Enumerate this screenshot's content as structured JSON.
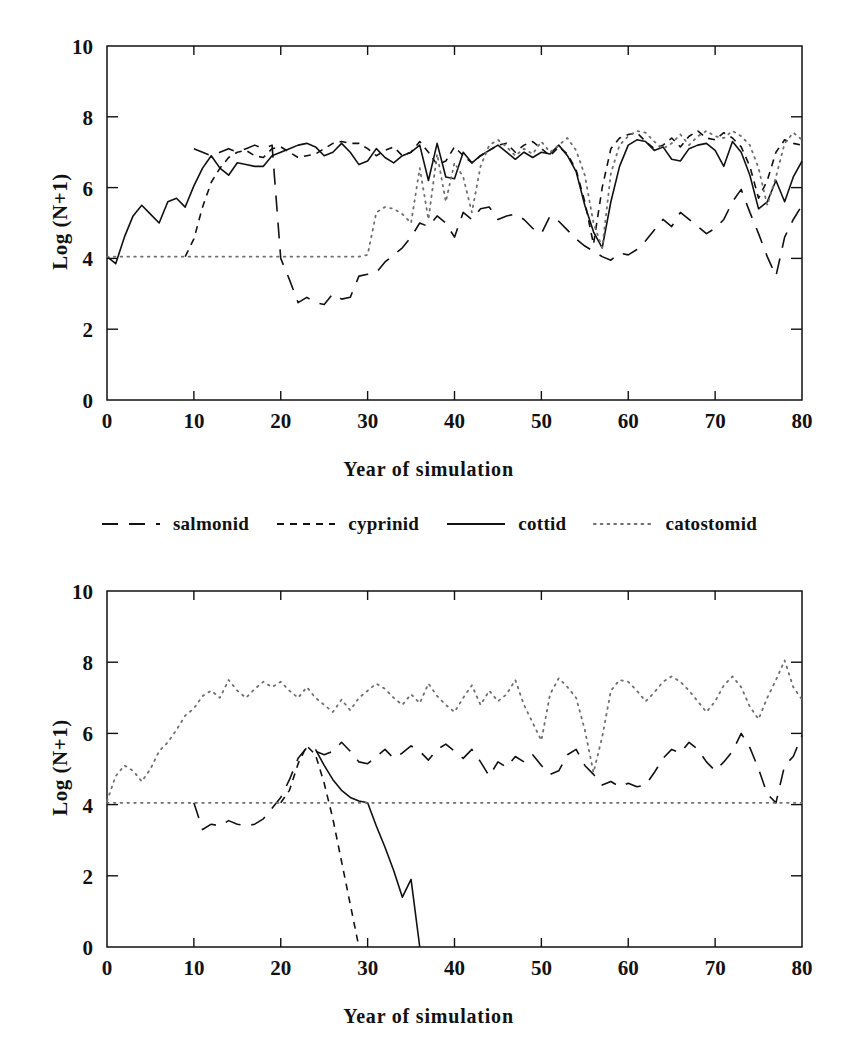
{
  "page": {
    "faint_header_text": "",
    "background": "#ffffff",
    "ink": "#111111"
  },
  "legend": {
    "name": "series-legend",
    "items": [
      {
        "label": "salmonid",
        "style": "long-dash",
        "dash": "16,11",
        "width": 1.6,
        "color": "#111111"
      },
      {
        "label": "cyprinid",
        "style": "short-dash",
        "dash": "7,6",
        "width": 1.6,
        "color": "#111111"
      },
      {
        "label": "cottid",
        "style": "solid",
        "dash": "none",
        "width": 1.6,
        "color": "#111111"
      },
      {
        "label": "catostomid",
        "style": "dotted",
        "dash": "1.6,5.2",
        "width": 1.8,
        "color": "#6e6e6e"
      }
    ]
  },
  "chart_data": [
    {
      "id": "top-panel",
      "type": "line",
      "title": "",
      "xlabel": "Year of simulation",
      "ylabel": "Log (N+1)",
      "xlim": [
        0,
        80
      ],
      "ylim": [
        0,
        10
      ],
      "xticks": [
        0,
        10,
        20,
        30,
        40,
        50,
        60,
        70,
        80
      ],
      "yticks": [
        0,
        2,
        4,
        6,
        8,
        10
      ],
      "grid": false,
      "legend_position": "below-panel",
      "series": [
        {
          "name": "salmonid",
          "style": "long-dash",
          "x": [
            10,
            11,
            12,
            13,
            14,
            15,
            16,
            17,
            18,
            19,
            20,
            21,
            22,
            23,
            24,
            25,
            26,
            27,
            28,
            29,
            30,
            31,
            32,
            33,
            34,
            35,
            36,
            37,
            38,
            39,
            40,
            41,
            42,
            43,
            44,
            45,
            46,
            47,
            48,
            49,
            50,
            51,
            52,
            53,
            54,
            55,
            56,
            57,
            58,
            59,
            60,
            61,
            62,
            63,
            64,
            65,
            66,
            67,
            68,
            69,
            70,
            71,
            72,
            73,
            74,
            75,
            76,
            77,
            78,
            79,
            80
          ],
          "values": [
            7.1,
            7.0,
            6.9,
            7.0,
            7.1,
            7.0,
            7.1,
            7.2,
            7.1,
            7.2,
            4.0,
            3.4,
            2.75,
            2.9,
            2.75,
            2.7,
            3.0,
            2.85,
            2.9,
            3.5,
            3.55,
            3.6,
            3.9,
            4.1,
            4.3,
            4.6,
            5.0,
            4.9,
            5.2,
            5.0,
            4.6,
            5.3,
            5.1,
            5.4,
            5.45,
            5.1,
            5.2,
            5.25,
            5.1,
            4.85,
            4.7,
            5.2,
            5.05,
            4.8,
            4.55,
            4.35,
            4.2,
            4.05,
            3.95,
            4.15,
            4.1,
            4.25,
            4.5,
            4.8,
            5.1,
            4.9,
            5.3,
            5.1,
            4.9,
            4.7,
            4.85,
            5.1,
            5.6,
            5.95,
            5.3,
            4.7,
            4.05,
            3.5,
            4.6,
            5.1,
            5.5
          ]
        },
        {
          "name": "cyprinid",
          "style": "short-dash",
          "x": [
            9,
            10,
            11,
            12,
            13,
            14,
            15,
            16,
            17,
            18,
            19,
            20,
            21,
            22,
            23,
            24,
            25,
            26,
            27,
            28,
            29,
            30,
            31,
            32,
            33,
            34,
            35,
            36,
            37,
            38,
            39,
            40,
            41,
            42,
            43,
            44,
            45,
            46,
            47,
            48,
            49,
            50,
            51,
            52,
            53,
            54,
            55,
            56,
            57,
            58,
            59,
            60,
            61,
            62,
            63,
            64,
            65,
            66,
            67,
            68,
            69,
            70,
            71,
            72,
            73,
            74,
            75,
            76,
            77,
            78,
            79,
            80
          ],
          "values": [
            4.05,
            4.55,
            5.45,
            6.15,
            6.55,
            6.85,
            7.0,
            7.05,
            6.9,
            6.85,
            7.1,
            7.15,
            7.0,
            6.85,
            6.9,
            6.95,
            7.1,
            7.25,
            7.3,
            7.25,
            7.25,
            7.1,
            6.9,
            7.05,
            7.15,
            6.9,
            7.0,
            7.3,
            7.0,
            6.65,
            6.75,
            7.15,
            6.9,
            6.7,
            6.9,
            7.05,
            7.2,
            7.25,
            7.0,
            7.2,
            7.3,
            7.1,
            6.9,
            7.15,
            6.95,
            6.5,
            5.6,
            4.4,
            6.0,
            7.1,
            7.4,
            7.5,
            7.55,
            7.3,
            7.1,
            7.2,
            7.4,
            7.15,
            7.45,
            7.6,
            7.4,
            7.35,
            7.55,
            7.4,
            7.15,
            6.6,
            5.7,
            6.2,
            7.0,
            7.35,
            7.25,
            7.2
          ]
        },
        {
          "name": "cottid",
          "style": "solid",
          "x": [
            0,
            1,
            2,
            3,
            4,
            5,
            6,
            7,
            8,
            9,
            10,
            11,
            12,
            13,
            14,
            15,
            16,
            17,
            18,
            19,
            20,
            21,
            22,
            23,
            24,
            25,
            26,
            27,
            28,
            29,
            30,
            31,
            32,
            33,
            34,
            35,
            36,
            37,
            38,
            39,
            40,
            41,
            42,
            43,
            44,
            45,
            46,
            47,
            48,
            49,
            50,
            51,
            52,
            53,
            54,
            55,
            56,
            57,
            58,
            59,
            60,
            61,
            62,
            63,
            64,
            65,
            66,
            67,
            68,
            69,
            70,
            71,
            72,
            73,
            74,
            75,
            76,
            77,
            78,
            79,
            80
          ],
          "values": [
            4.05,
            3.85,
            4.6,
            5.2,
            5.5,
            5.25,
            5.0,
            5.6,
            5.7,
            5.45,
            6.05,
            6.55,
            6.9,
            6.55,
            6.35,
            6.7,
            6.65,
            6.6,
            6.6,
            6.9,
            7.0,
            7.1,
            7.2,
            7.25,
            7.15,
            6.9,
            7.0,
            7.25,
            7.0,
            6.65,
            6.75,
            7.1,
            6.85,
            6.7,
            6.9,
            7.0,
            7.2,
            6.2,
            7.25,
            6.3,
            6.25,
            7.0,
            6.7,
            6.9,
            7.05,
            7.2,
            7.0,
            6.8,
            7.0,
            6.85,
            7.0,
            6.95,
            7.2,
            6.9,
            6.45,
            5.5,
            4.75,
            4.3,
            5.6,
            6.6,
            7.2,
            7.35,
            7.3,
            7.05,
            7.15,
            6.8,
            6.75,
            7.1,
            7.2,
            7.25,
            7.05,
            6.6,
            7.3,
            7.0,
            6.35,
            5.4,
            5.6,
            6.2,
            5.6,
            6.3,
            6.75
          ]
        },
        {
          "name": "catostomid",
          "style": "dotted",
          "x": [
            0,
            1,
            2,
            3,
            4,
            5,
            6,
            7,
            8,
            9,
            10,
            11,
            12,
            13,
            14,
            15,
            16,
            17,
            18,
            19,
            20,
            21,
            22,
            23,
            24,
            25,
            26,
            27,
            28,
            29,
            30,
            31,
            32,
            33,
            34,
            35,
            36,
            37,
            38,
            39,
            40,
            41,
            42,
            43,
            44,
            45,
            46,
            47,
            48,
            49,
            50,
            51,
            52,
            53,
            54,
            55,
            56,
            57,
            58,
            59,
            60,
            61,
            62,
            63,
            64,
            65,
            66,
            67,
            68,
            69,
            70,
            71,
            72,
            73,
            74,
            75,
            76,
            77,
            78,
            79,
            80
          ],
          "values": [
            4.05,
            4.05,
            4.05,
            4.05,
            4.05,
            4.05,
            4.05,
            4.05,
            4.05,
            4.05,
            4.05,
            4.05,
            4.05,
            4.05,
            4.05,
            4.05,
            4.05,
            4.05,
            4.05,
            4.05,
            4.05,
            4.05,
            4.05,
            4.05,
            4.05,
            4.05,
            4.05,
            4.05,
            4.05,
            4.05,
            4.1,
            5.3,
            5.45,
            5.4,
            5.25,
            5.0,
            6.55,
            5.1,
            6.95,
            5.6,
            6.7,
            6.3,
            5.3,
            6.6,
            7.2,
            7.35,
            7.15,
            6.9,
            7.1,
            6.95,
            7.3,
            7.0,
            7.2,
            7.4,
            7.05,
            6.35,
            5.0,
            4.3,
            6.4,
            7.2,
            7.45,
            7.6,
            7.55,
            7.3,
            7.1,
            7.25,
            7.5,
            7.2,
            7.45,
            7.6,
            7.45,
            7.4,
            7.6,
            7.45,
            7.2,
            6.55,
            5.5,
            6.3,
            7.25,
            7.55,
            7.35
          ]
        }
      ]
    },
    {
      "id": "bottom-panel",
      "type": "line",
      "title": "",
      "xlabel": "Year of simulation",
      "ylabel": "Log (N+1)",
      "xlim": [
        0,
        80
      ],
      "ylim": [
        0,
        10
      ],
      "xticks": [
        0,
        10,
        20,
        30,
        40,
        50,
        60,
        70,
        80
      ],
      "yticks": [
        0,
        2,
        4,
        6,
        8,
        10
      ],
      "grid": false,
      "legend_position": "above-panel",
      "series": [
        {
          "name": "salmonid",
          "style": "long-dash",
          "x": [
            10,
            11,
            12,
            13,
            14,
            15,
            16,
            17,
            18,
            19,
            20,
            21,
            22,
            23,
            24,
            25,
            26,
            27,
            28,
            29,
            30,
            31,
            32,
            33,
            34,
            35,
            36,
            37,
            38,
            39,
            40,
            41,
            42,
            43,
            44,
            45,
            46,
            47,
            48,
            49,
            50,
            51,
            52,
            53,
            54,
            55,
            56,
            57,
            58,
            59,
            60,
            61,
            62,
            63,
            64,
            65,
            66,
            67,
            68,
            69,
            70,
            71,
            72,
            73,
            74,
            75,
            76,
            77,
            78,
            79,
            80
          ],
          "values": [
            4.05,
            3.3,
            3.45,
            3.4,
            3.55,
            3.45,
            3.4,
            3.45,
            3.6,
            3.9,
            4.2,
            4.7,
            5.3,
            5.6,
            5.5,
            5.4,
            5.5,
            5.75,
            5.5,
            5.2,
            5.15,
            5.35,
            5.55,
            5.3,
            5.45,
            5.65,
            5.5,
            5.25,
            5.55,
            5.7,
            5.5,
            5.3,
            5.55,
            5.2,
            4.8,
            5.2,
            5.05,
            5.35,
            5.2,
            5.4,
            5.1,
            4.85,
            4.95,
            5.4,
            5.55,
            5.1,
            4.85,
            4.55,
            4.65,
            4.5,
            4.6,
            4.5,
            4.55,
            4.9,
            5.3,
            5.55,
            5.45,
            5.75,
            5.55,
            5.2,
            4.95,
            5.2,
            5.5,
            6.0,
            5.6,
            5.0,
            4.3,
            4.05,
            5.1,
            5.35,
            5.95
          ]
        },
        {
          "name": "cyprinid",
          "style": "short-dash",
          "x": [
            20,
            21,
            22,
            23,
            24,
            25,
            26,
            27,
            28,
            29
          ],
          "values": [
            4.05,
            4.4,
            5.15,
            5.65,
            5.4,
            4.6,
            3.6,
            2.4,
            1.2,
            0.0
          ]
        },
        {
          "name": "cottid",
          "style": "solid",
          "x": [
            24,
            25,
            26,
            27,
            28,
            29,
            30,
            31,
            32,
            33,
            34,
            35,
            36
          ],
          "values": [
            5.55,
            5.1,
            4.7,
            4.4,
            4.2,
            4.1,
            4.05,
            3.4,
            2.8,
            2.15,
            1.4,
            1.9,
            0.0
          ]
        },
        {
          "name": "catostomid",
          "style": "dotted",
          "x": [
            0,
            1,
            2,
            3,
            4,
            5,
            6,
            7,
            8,
            9,
            10,
            11,
            12,
            13,
            14,
            15,
            16,
            17,
            18,
            19,
            20,
            21,
            22,
            23,
            24,
            25,
            26,
            27,
            28,
            29,
            30,
            31,
            32,
            33,
            34,
            35,
            36,
            37,
            38,
            39,
            40,
            41,
            42,
            43,
            44,
            45,
            46,
            47,
            48,
            49,
            50,
            51,
            52,
            53,
            54,
            55,
            56,
            57,
            58,
            59,
            60,
            61,
            62,
            63,
            64,
            65,
            66,
            67,
            68,
            69,
            70,
            71,
            72,
            73,
            74,
            75,
            76,
            77,
            78,
            79,
            80
          ],
          "values": [
            4.1,
            4.8,
            5.1,
            4.95,
            4.65,
            5.0,
            5.5,
            5.75,
            6.1,
            6.5,
            6.7,
            7.05,
            7.2,
            7.0,
            7.5,
            7.2,
            7.0,
            7.25,
            7.45,
            7.3,
            7.45,
            7.2,
            7.0,
            7.3,
            7.0,
            6.8,
            6.6,
            6.95,
            6.65,
            7.0,
            7.2,
            7.4,
            7.25,
            7.0,
            6.8,
            7.1,
            6.85,
            7.4,
            7.05,
            6.8,
            6.6,
            7.0,
            7.35,
            6.8,
            7.2,
            6.9,
            7.1,
            7.5,
            6.8,
            6.3,
            5.8,
            7.1,
            7.55,
            7.3,
            7.0,
            6.1,
            4.9,
            5.9,
            7.2,
            7.5,
            7.45,
            7.2,
            6.9,
            7.15,
            7.45,
            7.6,
            7.45,
            7.2,
            6.9,
            6.6,
            6.9,
            7.35,
            7.6,
            7.3,
            6.75,
            6.4,
            7.0,
            7.5,
            8.05,
            7.3,
            6.95
          ]
        }
      ],
      "reference_line": {
        "name": "catostomid-baseline",
        "y": 4.05,
        "style": "dotted"
      }
    }
  ]
}
